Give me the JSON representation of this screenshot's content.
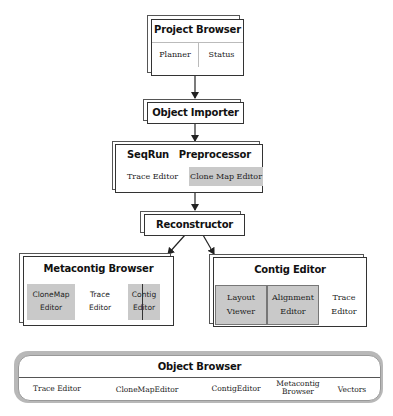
{
  "diagram": {
    "type": "architecture-hierarchy",
    "nodes": [
      {
        "id": "project_browser",
        "title": "Project Browser",
        "children": [
          "Planner",
          "Status"
        ]
      },
      {
        "id": "object_importer",
        "title": "Object Importer"
      },
      {
        "id": "seqrun_preprocessor",
        "title": "SeqRun   Preprocessor",
        "children": [
          "Trace Editor",
          "Clone Map Editor"
        ]
      },
      {
        "id": "reconstructor",
        "title": "Reconstructor"
      },
      {
        "id": "metacontig_browser",
        "title": "Metacontig Browser",
        "children": [
          "CloneMap Editor",
          "Trace Editor",
          "Contig Editor"
        ]
      },
      {
        "id": "contig_editor",
        "title": "Contig Editor",
        "children": [
          "Layout Viewer",
          "Alignment Editor",
          "Trace Editor"
        ]
      },
      {
        "id": "object_browser",
        "title": "Object Browser",
        "children": [
          "Trace Editor",
          "CloneMapEditor",
          "ContigEditor",
          "Metacontig Browser",
          "Vectors"
        ]
      }
    ],
    "edges": [
      {
        "from": "project_browser",
        "to": "object_importer"
      },
      {
        "from": "object_importer",
        "to": "seqrun_preprocessor"
      },
      {
        "from": "seqrun_preprocessor",
        "to": "reconstructor"
      },
      {
        "from": "reconstructor",
        "to": "metacontig_browser"
      },
      {
        "from": "reconstructor",
        "to": "contig_editor"
      }
    ]
  },
  "project_browser": {
    "title": "Project Browser",
    "planner": "Planner",
    "status": "Status"
  },
  "object_importer": {
    "title": "Object Importer"
  },
  "seqrun": {
    "title_left": "SeqRun",
    "title_right": "Preprocessor",
    "trace_editor": "Trace Editor",
    "clone_map_editor": "Clone Map Editor"
  },
  "reconstructor": {
    "title": "Reconstructor"
  },
  "metacontig": {
    "title": "Metacontig Browser",
    "clonemap_l1": "CloneMap",
    "clonemap_l2": "Editor",
    "trace_l1": "Trace",
    "trace_l2": "Editor",
    "contig_l1": "Contig",
    "contig_l2": "Editor"
  },
  "contig_editor": {
    "title": "Contig Editor",
    "layout_l1": "Layout",
    "layout_l2": "Viewer",
    "alignment_l1": "Alignment",
    "alignment_l2": "Editor",
    "trace_l1": "Trace",
    "trace_l2": "Editor"
  },
  "object_browser": {
    "title": "Object Browser",
    "trace_editor": "Trace Editor",
    "clonemap_editor": "CloneMapEditor",
    "contig_editor": "ContigEditor",
    "metacontig_l1": "Metacontig",
    "metacontig_l2": "Browser",
    "vectors": "Vectors"
  },
  "colors": {
    "line": "#333333",
    "gray_fill": "#c9c9c9",
    "background": "#ffffff"
  }
}
